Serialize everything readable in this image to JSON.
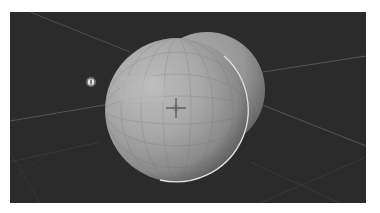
{
  "app": {
    "view": "3d-viewport",
    "shading_mode": "solid"
  },
  "viewport": {
    "background_color": "#2b2b2b",
    "grid_line_color": "#5a5a5a",
    "grid_line_faint_color": "#3c3c3c"
  },
  "scene": {
    "objects": [
      {
        "name": "sphere-front",
        "type": "uv-sphere",
        "selected": true,
        "outline_color": "#e8e2d6",
        "center": [
          167,
          98
        ],
        "radius": 72,
        "color_light": "#b4b4b4",
        "color_mid": "#9a9a9a",
        "color_dark": "#4a4a4a"
      },
      {
        "name": "sphere-back",
        "type": "uv-sphere",
        "selected": false,
        "center": [
          197,
          78
        ],
        "radius": 58,
        "color_light": "#a8a8a8",
        "color_dark": "#5a5a5a"
      },
      {
        "name": "light",
        "type": "light-marker",
        "position": [
          81,
          70
        ]
      }
    ],
    "cursor_3d": {
      "position": [
        166,
        96
      ]
    }
  }
}
